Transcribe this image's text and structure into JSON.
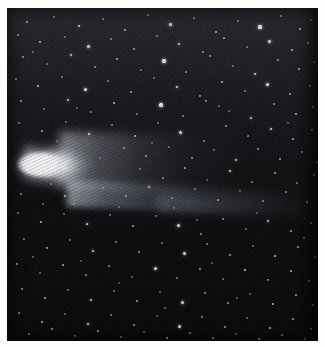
{
  "image": {
    "subject": "comet",
    "title": "Comet with bright coma and extended dust tail against a star field",
    "medium": "astronomical photographic plate",
    "alt_text": "A brilliant white comet head at left with a broad tail fanning out toward the right across a dense field of stars",
    "width_px": 325,
    "height_px": 347,
    "border_color": "#fdfdfb",
    "sky_color": "#0a0a0d",
    "comet_color": "#ffffff",
    "tail_color": "#c6cedc",
    "star_color": "#ffffff"
  },
  "frame": {
    "border_px": {
      "top": 8,
      "left": 7,
      "right": 7,
      "bottom": 6
    },
    "plate": {
      "x": 7,
      "y": 8,
      "width": 311,
      "height": 333
    }
  },
  "comet": {
    "name": "comet",
    "coma_label": "comet-coma",
    "nucleus_label": "comet-nucleus",
    "tail_label": "comet-tail",
    "coma_center": {
      "x": 36,
      "y": 157
    },
    "coma_size": {
      "width": 68,
      "height": 27
    },
    "tail_direction": "right",
    "tail_extent_px": 300,
    "tail_tilt_deg": 2.6,
    "brightness": "saturated white core"
  },
  "star_field": {
    "label": "star-field",
    "description": "dense field of point-source stars, brighter and denser in the upper half",
    "star_count": 340,
    "density_upper": "high",
    "density_lower": "moderate"
  },
  "stars": [
    [
      20,
      14,
      1.2,
      0.7
    ],
    [
      47,
      9,
      1.0,
      0.55
    ],
    [
      72,
      18,
      1.4,
      0.85
    ],
    [
      96,
      11,
      1.0,
      0.5
    ],
    [
      118,
      22,
      1.2,
      0.72
    ],
    [
      141,
      7,
      1.0,
      0.48
    ],
    [
      163,
      16,
      1.5,
      0.9
    ],
    [
      187,
      10,
      1.1,
      0.6
    ],
    [
      209,
      24,
      1.2,
      0.66
    ],
    [
      231,
      13,
      1.0,
      0.52
    ],
    [
      253,
      19,
      1.6,
      0.95
    ],
    [
      274,
      8,
      1.1,
      0.58
    ],
    [
      293,
      21,
      1.3,
      0.76
    ],
    [
      304,
      12,
      1.0,
      0.5
    ],
    [
      11,
      27,
      1.1,
      0.62
    ],
    [
      33,
      34,
      1.3,
      0.78
    ],
    [
      58,
      29,
      1.0,
      0.46
    ],
    [
      81,
      38,
      1.5,
      0.88
    ],
    [
      104,
      31,
      1.1,
      0.56
    ],
    [
      127,
      41,
      1.2,
      0.7
    ],
    [
      150,
      28,
      1.0,
      0.5
    ],
    [
      172,
      36,
      1.4,
      0.84
    ],
    [
      196,
      44,
      1.1,
      0.58
    ],
    [
      217,
      30,
      1.2,
      0.68
    ],
    [
      240,
      39,
      1.0,
      0.46
    ],
    [
      262,
      33,
      1.5,
      0.9
    ],
    [
      285,
      42,
      1.2,
      0.72
    ],
    [
      301,
      35,
      1.0,
      0.54
    ],
    [
      16,
      49,
      1.2,
      0.66
    ],
    [
      40,
      56,
      1.0,
      0.48
    ],
    [
      64,
      47,
      1.4,
      0.86
    ],
    [
      88,
      59,
      1.1,
      0.6
    ],
    [
      110,
      51,
      1.3,
      0.74
    ],
    [
      134,
      62,
      1.0,
      0.46
    ],
    [
      157,
      53,
      1.6,
      0.94
    ],
    [
      179,
      64,
      1.1,
      0.56
    ],
    [
      203,
      48,
      1.2,
      0.7
    ],
    [
      226,
      58,
      1.0,
      0.5
    ],
    [
      248,
      66,
      1.4,
      0.82
    ],
    [
      271,
      52,
      1.1,
      0.62
    ],
    [
      292,
      61,
      1.3,
      0.76
    ],
    [
      307,
      54,
      1.0,
      0.44
    ],
    [
      9,
      71,
      1.1,
      0.58
    ],
    [
      31,
      78,
      1.3,
      0.8
    ],
    [
      55,
      69,
      1.0,
      0.48
    ],
    [
      78,
      81,
      1.5,
      0.9
    ],
    [
      101,
      73,
      1.1,
      0.56
    ],
    [
      124,
      84,
      1.2,
      0.68
    ],
    [
      147,
      70,
      1.0,
      0.46
    ],
    [
      170,
      79,
      1.4,
      0.86
    ],
    [
      193,
      88,
      1.1,
      0.6
    ],
    [
      215,
      74,
      1.2,
      0.72
    ],
    [
      238,
      83,
      1.0,
      0.5
    ],
    [
      260,
      76,
      1.5,
      0.92
    ],
    [
      283,
      86,
      1.2,
      0.66
    ],
    [
      303,
      78,
      1.0,
      0.48
    ],
    [
      14,
      93,
      1.2,
      0.7
    ],
    [
      37,
      101,
      1.0,
      0.46
    ],
    [
      61,
      92,
      1.4,
      0.84
    ],
    [
      84,
      104,
      1.1,
      0.58
    ],
    [
      107,
      95,
      1.3,
      0.78
    ],
    [
      130,
      106,
      1.0,
      0.5
    ],
    [
      154,
      97,
      1.6,
      0.96
    ],
    [
      176,
      108,
      1.1,
      0.56
    ],
    [
      199,
      93,
      1.2,
      0.68
    ],
    [
      222,
      103,
      1.0,
      0.44
    ],
    [
      244,
      110,
      1.4,
      0.82
    ],
    [
      267,
      96,
      1.1,
      0.62
    ],
    [
      289,
      106,
      1.3,
      0.74
    ],
    [
      306,
      99,
      1.0,
      0.48
    ],
    [
      12,
      115,
      1.1,
      0.6
    ],
    [
      35,
      123,
      1.3,
      0.78
    ],
    [
      59,
      114,
      1.0,
      0.46
    ],
    [
      82,
      126,
      1.4,
      0.88
    ],
    [
      105,
      117,
      1.1,
      0.54
    ],
    [
      128,
      128,
      1.2,
      0.7
    ],
    [
      151,
      115,
      1.0,
      0.48
    ],
    [
      173,
      124,
      1.5,
      0.9
    ],
    [
      197,
      133,
      1.1,
      0.58
    ],
    [
      219,
      118,
      1.2,
      0.66
    ],
    [
      241,
      128,
      1.0,
      0.5
    ],
    [
      264,
      121,
      1.4,
      0.84
    ],
    [
      286,
      131,
      1.2,
      0.72
    ],
    [
      305,
      122,
      1.0,
      0.46
    ],
    [
      117,
      140,
      1.1,
      0.62
    ],
    [
      139,
      148,
      1.3,
      0.8
    ],
    [
      162,
      139,
      1.0,
      0.46
    ],
    [
      185,
      150,
      1.2,
      0.7
    ],
    [
      207,
      142,
      1.0,
      0.52
    ],
    [
      229,
      152,
      1.4,
      0.86
    ],
    [
      251,
      141,
      1.1,
      0.58
    ],
    [
      273,
      151,
      1.2,
      0.68
    ],
    [
      295,
      144,
      1.0,
      0.48
    ],
    [
      310,
      154,
      1.1,
      0.56
    ],
    [
      133,
      161,
      1.0,
      0.5
    ],
    [
      156,
      170,
      1.2,
      0.66
    ],
    [
      178,
      160,
      1.3,
      0.78
    ],
    [
      200,
      172,
      1.0,
      0.46
    ],
    [
      223,
      163,
      1.4,
      0.84
    ],
    [
      245,
      174,
      1.1,
      0.56
    ],
    [
      268,
      165,
      1.2,
      0.7
    ],
    [
      290,
      175,
      1.0,
      0.48
    ],
    [
      307,
      167,
      1.1,
      0.58
    ],
    [
      96,
      180,
      1.0,
      0.44
    ],
    [
      119,
      188,
      1.2,
      0.64
    ],
    [
      142,
      179,
      1.4,
      0.82
    ],
    [
      165,
      190,
      1.0,
      0.48
    ],
    [
      188,
      181,
      1.1,
      0.58
    ],
    [
      211,
      192,
      1.3,
      0.74
    ],
    [
      233,
      183,
      1.0,
      0.46
    ],
    [
      256,
      193,
      1.2,
      0.66
    ],
    [
      279,
      184,
      1.1,
      0.56
    ],
    [
      300,
      194,
      1.0,
      0.5
    ],
    [
      14,
      186,
      1.2,
      0.7
    ],
    [
      36,
      196,
      1.0,
      0.46
    ],
    [
      58,
      188,
      1.3,
      0.76
    ],
    [
      11,
      205,
      1.1,
      0.6
    ],
    [
      34,
      214,
      1.3,
      0.8
    ],
    [
      57,
      206,
      1.0,
      0.46
    ],
    [
      80,
      216,
      1.4,
      0.86
    ],
    [
      103,
      207,
      1.1,
      0.56
    ],
    [
      126,
      218,
      1.2,
      0.68
    ],
    [
      149,
      208,
      1.0,
      0.48
    ],
    [
      171,
      217,
      1.5,
      0.9
    ],
    [
      194,
      226,
      1.1,
      0.58
    ],
    [
      216,
      211,
      1.2,
      0.66
    ],
    [
      239,
      221,
      1.0,
      0.5
    ],
    [
      261,
      213,
      1.4,
      0.82
    ],
    [
      284,
      223,
      1.2,
      0.7
    ],
    [
      304,
      215,
      1.0,
      0.46
    ],
    [
      17,
      231,
      1.1,
      0.62
    ],
    [
      40,
      240,
      1.3,
      0.78
    ],
    [
      63,
      232,
      1.0,
      0.44
    ],
    [
      86,
      243,
      1.4,
      0.84
    ],
    [
      109,
      234,
      1.1,
      0.54
    ],
    [
      132,
      244,
      1.2,
      0.66
    ],
    [
      155,
      235,
      1.0,
      0.48
    ],
    [
      177,
      245,
      1.5,
      0.88
    ],
    [
      200,
      236,
      1.1,
      0.56
    ],
    [
      223,
      247,
      1.2,
      0.68
    ],
    [
      246,
      238,
      1.0,
      0.46
    ],
    [
      268,
      248,
      1.4,
      0.8
    ],
    [
      291,
      239,
      1.2,
      0.7
    ],
    [
      308,
      249,
      1.0,
      0.48
    ],
    [
      10,
      256,
      1.2,
      0.64
    ],
    [
      33,
      265,
      1.0,
      0.44
    ],
    [
      56,
      257,
      1.3,
      0.76
    ],
    [
      79,
      267,
      1.1,
      0.56
    ],
    [
      102,
      258,
      1.2,
      0.68
    ],
    [
      125,
      269,
      1.0,
      0.46
    ],
    [
      148,
      260,
      1.5,
      0.88
    ],
    [
      170,
      270,
      1.1,
      0.54
    ],
    [
      193,
      261,
      1.2,
      0.66
    ],
    [
      216,
      271,
      1.0,
      0.48
    ],
    [
      238,
      262,
      1.4,
      0.8
    ],
    [
      261,
      272,
      1.1,
      0.58
    ],
    [
      284,
      263,
      1.3,
      0.74
    ],
    [
      302,
      273,
      1.0,
      0.44
    ],
    [
      15,
      281,
      1.1,
      0.6
    ],
    [
      38,
      290,
      1.3,
      0.78
    ],
    [
      61,
      282,
      1.0,
      0.46
    ],
    [
      84,
      292,
      1.4,
      0.82
    ],
    [
      107,
      283,
      1.1,
      0.54
    ],
    [
      130,
      293,
      1.2,
      0.66
    ],
    [
      153,
      284,
      1.0,
      0.48
    ],
    [
      175,
      294,
      1.5,
      0.86
    ],
    [
      198,
      285,
      1.1,
      0.56
    ],
    [
      221,
      295,
      1.2,
      0.68
    ],
    [
      243,
      286,
      1.0,
      0.44
    ],
    [
      266,
      296,
      1.4,
      0.8
    ],
    [
      289,
      287,
      1.2,
      0.7
    ],
    [
      306,
      297,
      1.0,
      0.48
    ],
    [
      12,
      305,
      1.1,
      0.58
    ],
    [
      35,
      314,
      1.3,
      0.76
    ],
    [
      58,
      306,
      1.0,
      0.44
    ],
    [
      81,
      316,
      1.4,
      0.84
    ],
    [
      104,
      307,
      1.1,
      0.56
    ],
    [
      127,
      317,
      1.2,
      0.66
    ],
    [
      150,
      308,
      1.0,
      0.46
    ],
    [
      172,
      318,
      1.5,
      0.88
    ],
    [
      195,
      309,
      1.1,
      0.54
    ],
    [
      218,
      319,
      1.2,
      0.68
    ],
    [
      240,
      310,
      1.0,
      0.48
    ],
    [
      263,
      320,
      1.4,
      0.78
    ],
    [
      286,
      311,
      1.2,
      0.7
    ],
    [
      304,
      321,
      1.0,
      0.46
    ],
    [
      22,
      326,
      1.1,
      0.58
    ],
    [
      45,
      321,
      1.2,
      0.66
    ],
    [
      68,
      328,
      1.0,
      0.44
    ],
    [
      91,
      323,
      1.3,
      0.74
    ],
    [
      114,
      329,
      1.1,
      0.54
    ],
    [
      137,
      324,
      1.0,
      0.46
    ],
    [
      160,
      330,
      1.4,
      0.8
    ],
    [
      183,
      325,
      1.1,
      0.56
    ],
    [
      206,
      330,
      1.2,
      0.64
    ],
    [
      229,
      326,
      1.0,
      0.44
    ],
    [
      252,
      331,
      1.3,
      0.72
    ],
    [
      275,
      327,
      1.1,
      0.54
    ],
    [
      298,
      331,
      1.0,
      0.46
    ],
    [
      26,
      44,
      1.0,
      0.42
    ],
    [
      70,
      100,
      1.0,
      0.4
    ],
    [
      145,
      135,
      1.0,
      0.42
    ],
    [
      212,
      98,
      1.0,
      0.44
    ],
    [
      281,
      115,
      1.0,
      0.4
    ],
    [
      50,
      133,
      1.0,
      0.38
    ],
    [
      93,
      150,
      1.0,
      0.4
    ],
    [
      167,
      200,
      1.0,
      0.42
    ],
    [
      250,
      205,
      1.0,
      0.38
    ],
    [
      297,
      230,
      1.0,
      0.4
    ],
    [
      44,
      176,
      1.0,
      0.4
    ],
    [
      67,
      196,
      1.0,
      0.42
    ],
    [
      112,
      199,
      1.0,
      0.38
    ],
    [
      190,
      212,
      1.0,
      0.44
    ],
    [
      205,
      255,
      1.0,
      0.4
    ],
    [
      112,
      275,
      1.0,
      0.38
    ],
    [
      158,
      300,
      1.0,
      0.42
    ],
    [
      230,
      290,
      1.0,
      0.4
    ],
    [
      74,
      253,
      1.0,
      0.38
    ],
    [
      26,
      249,
      1.0,
      0.42
    ]
  ]
}
